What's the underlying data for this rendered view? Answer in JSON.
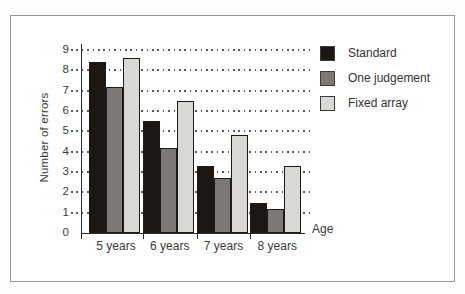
{
  "chart_data": {
    "type": "bar",
    "title": "",
    "xlabel": "Age",
    "ylabel": "Number of errors",
    "categories": [
      "5 years",
      "6 years",
      "7 years",
      "8 years"
    ],
    "series": [
      {
        "name": "Standard",
        "color": "#1c1713",
        "values": [
          8.4,
          5.5,
          3.3,
          1.5
        ]
      },
      {
        "name": "One judgement",
        "color": "#7c7874",
        "values": [
          7.2,
          4.2,
          2.7,
          1.2
        ]
      },
      {
        "name": "Fixed array",
        "color": "#dad8d4",
        "values": [
          8.6,
          6.5,
          4.8,
          3.3
        ]
      }
    ],
    "ylim": [
      0,
      9
    ],
    "yticks": [
      0,
      1,
      2,
      3,
      4,
      5,
      6,
      7,
      8,
      9
    ],
    "grid": "dotted-horizontal",
    "legend_position": "top-right",
    "colors": {
      "axis": "#2a2a2a",
      "grid_dots": "#5b5b5b",
      "frame_border": "#979797",
      "background": "#ffffff"
    }
  }
}
